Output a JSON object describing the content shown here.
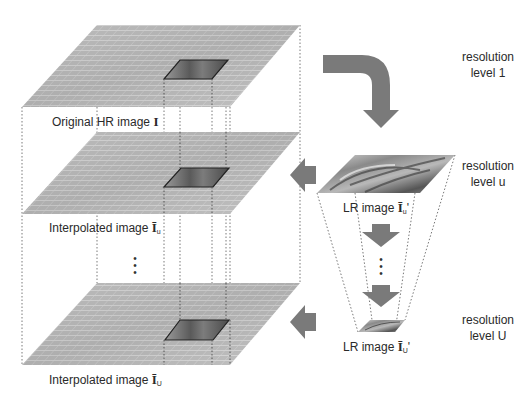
{
  "diagram": {
    "planes": [
      {
        "id": "hr",
        "label_text": "Original HR image ",
        "symbol": "I",
        "subscript": "",
        "prime": ""
      },
      {
        "id": "interp_u",
        "label_text": "Interpolated image ",
        "symbol": "Ī",
        "subscript": "u",
        "prime": ""
      },
      {
        "id": "interp_U",
        "label_text": "Interpolated image ",
        "symbol": "Ī",
        "subscript": "U",
        "prime": ""
      }
    ],
    "lr_images": [
      {
        "id": "lr_u",
        "label_text": "LR image ",
        "symbol": "Ī",
        "subscript": "u",
        "prime": "'"
      },
      {
        "id": "lr_U",
        "label_text": "LR image ",
        "symbol": "Ī",
        "subscript": "U",
        "prime": "'"
      }
    ],
    "resolution_levels": [
      {
        "line1": "resolution",
        "line2": "level 1"
      },
      {
        "line1": "resolution",
        "line2": "level u"
      },
      {
        "line1": "resolution",
        "line2": "level U"
      }
    ],
    "ellipsis": "⋮",
    "colors": {
      "arrow": "#7a7a7a",
      "grid_fill": "#c4c4c4",
      "grid_line": "#f0f0f0",
      "dotted_line": "#777777",
      "highlight_border": "#222222"
    }
  }
}
